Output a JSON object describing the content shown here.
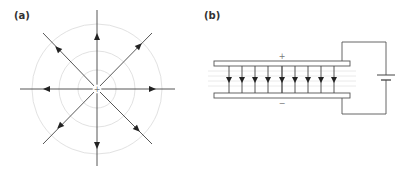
{
  "panels": [
    {
      "label": "(a)",
      "title": "Radial electric field of a positive point charge",
      "charge_symbol": "+",
      "field_line_count": 8,
      "equipotential_circle_count": 3
    },
    {
      "label": "(b)",
      "title": "Uniform field between parallel capacitor plates connected to a battery",
      "top_plate_sign": "+",
      "bottom_plate_sign": "−",
      "field_arrow_count": 9
    }
  ],
  "colors": {
    "line": "#333333",
    "equipotential": "#dddddd",
    "label": "#333333"
  }
}
